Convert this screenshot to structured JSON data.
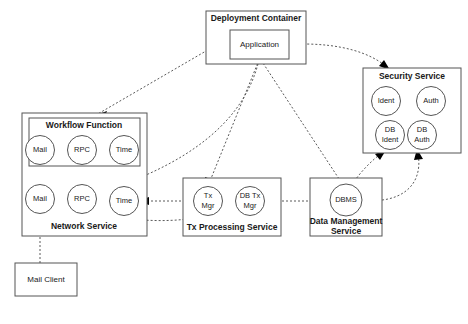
{
  "diagram": {
    "background_color": "#ffffff",
    "box_stroke_color": "#555555",
    "connector_color": "#5a5a5a",
    "text_color": "#1a1a1a",
    "containers": [
      {
        "id": "deployment-container",
        "label": "Deployment Container"
      },
      {
        "id": "security-service",
        "label": "Security Service"
      },
      {
        "id": "network-service",
        "label": "Network Service"
      },
      {
        "id": "workflow-function",
        "label": "Workflow Function"
      },
      {
        "id": "tx-processing-service",
        "label": "Tx Processing Service"
      },
      {
        "id": "data-management-service-line1",
        "label": "Data Management"
      },
      {
        "id": "data-management-service-line2",
        "label": "Service"
      }
    ],
    "boxes": [
      {
        "id": "application",
        "label": "Application"
      },
      {
        "id": "mail-client",
        "label": "Mail Client"
      }
    ],
    "nodes": [
      {
        "id": "wf-mail",
        "label": "Mail"
      },
      {
        "id": "wf-rpc",
        "label": "RPC"
      },
      {
        "id": "wf-time",
        "label": "Time"
      },
      {
        "id": "ns-mail",
        "label": "Mail"
      },
      {
        "id": "ns-rpc",
        "label": "RPC"
      },
      {
        "id": "ns-time",
        "label": "Time"
      },
      {
        "id": "sec-ident",
        "label": "Ident"
      },
      {
        "id": "sec-auth",
        "label": "Auth"
      },
      {
        "id": "sec-db-ident-line1",
        "label": "DB"
      },
      {
        "id": "sec-db-ident-line2",
        "label": "Ident"
      },
      {
        "id": "sec-db-auth-line1",
        "label": "DB"
      },
      {
        "id": "sec-db-auth-line2",
        "label": "Auth"
      },
      {
        "id": "tx-mgr-line1",
        "label": "Tx"
      },
      {
        "id": "tx-mgr-line2",
        "label": "Mgr"
      },
      {
        "id": "db-tx-mgr-line1",
        "label": "DB Tx"
      },
      {
        "id": "db-tx-mgr-line2",
        "label": "Mgr"
      },
      {
        "id": "dbms",
        "label": "DBMS"
      }
    ],
    "connections": [
      {
        "id": "app-to-workflow",
        "from": "application",
        "to": "workflow-function",
        "style": "dashed-arrow"
      },
      {
        "id": "app-to-security",
        "from": "application",
        "to": "security-service",
        "style": "dashed-arrow"
      },
      {
        "id": "app-to-rpc",
        "from": "application",
        "to": "ns-rpc",
        "style": "dashed-arrow"
      },
      {
        "id": "app-to-tx-mgr",
        "from": "application",
        "to": "tx-mgr",
        "style": "dashed-arrow"
      },
      {
        "id": "app-to-dbms",
        "from": "application",
        "to": "dbms",
        "style": "dashed-arrow"
      },
      {
        "id": "wf-mail-to-ns-mail",
        "from": "wf-mail",
        "to": "ns-mail",
        "style": "dashed-arrow"
      },
      {
        "id": "wf-rpc-to-ns-rpc",
        "from": "wf-rpc",
        "to": "ns-rpc",
        "style": "dashed-arrow"
      },
      {
        "id": "tx-mgr-to-ns-time",
        "from": "tx-mgr",
        "to": "ns-time",
        "style": "dashed-arrow"
      },
      {
        "id": "tx-mgr-to-ns-rpc",
        "from": "tx-mgr",
        "to": "ns-rpc",
        "style": "dashed-arrow"
      },
      {
        "id": "dbms-to-db-tx-mgr",
        "from": "dbms",
        "to": "db-tx-mgr",
        "style": "dashed-arrow"
      },
      {
        "id": "dbms-to-db-ident",
        "from": "dbms",
        "to": "sec-db-ident",
        "style": "dashed-arrow"
      },
      {
        "id": "dbms-to-db-auth",
        "from": "dbms",
        "to": "sec-db-auth",
        "style": "dashed-arrow"
      },
      {
        "id": "mail-client-to-ns-mail",
        "from": "mail-client",
        "to": "ns-mail",
        "style": "dashed-arrow"
      }
    ]
  }
}
